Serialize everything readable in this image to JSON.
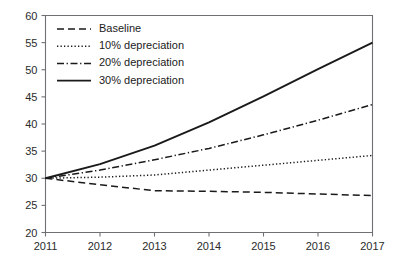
{
  "chart_data": {
    "type": "line",
    "title": "",
    "xlabel": "",
    "ylabel": "",
    "x": [
      2011,
      2012,
      2013,
      2014,
      2015,
      2016,
      2017
    ],
    "xtick_labels": [
      "2011",
      "2012",
      "2013",
      "2014",
      "2015",
      "2016",
      "2017"
    ],
    "ytick_labels": [
      "20",
      "25",
      "30",
      "35",
      "40",
      "45",
      "50",
      "55",
      "60"
    ],
    "ytick_values": [
      20,
      25,
      30,
      35,
      40,
      45,
      50,
      55,
      60
    ],
    "xlim": [
      2011,
      2017
    ],
    "ylim": [
      20,
      60
    ],
    "grid": false,
    "legend_position": "top-left",
    "series": [
      {
        "name": "Baseline",
        "dash": "dashed",
        "color": "#1a1a1a",
        "values": [
          30,
          28.8,
          27.7,
          27.6,
          27.4,
          27.1,
          26.8
        ]
      },
      {
        "name": "10% depreciation",
        "dash": "dotted",
        "color": "#1a1a1a",
        "values": [
          30,
          30.2,
          30.6,
          31.5,
          32.4,
          33.3,
          34.2
        ]
      },
      {
        "name": "20% depreciation",
        "dash": "dash-dot",
        "color": "#1a1a1a",
        "values": [
          30,
          31.5,
          33.4,
          35.5,
          38.0,
          40.7,
          43.6
        ]
      },
      {
        "name": "30% depreciation",
        "dash": "solid",
        "color": "#1a1a1a",
        "values": [
          30,
          32.6,
          36.0,
          40.3,
          45.1,
          50.1,
          55.0
        ]
      }
    ]
  },
  "axes": {
    "y_labels": [
      "60",
      "55",
      "50",
      "45",
      "40",
      "35",
      "30",
      "25",
      "20"
    ],
    "x_labels": [
      "2011",
      "2012",
      "2013",
      "2014",
      "2015",
      "2016",
      "2017"
    ]
  },
  "legend": {
    "items": [
      {
        "label": "Baseline"
      },
      {
        "label": "10% depreciation"
      },
      {
        "label": "20% depreciation"
      },
      {
        "label": "30% depreciation"
      }
    ]
  },
  "colors": {
    "ink": "#1a1a1a",
    "axis": "#6f7073",
    "background": "#ffffff"
  }
}
